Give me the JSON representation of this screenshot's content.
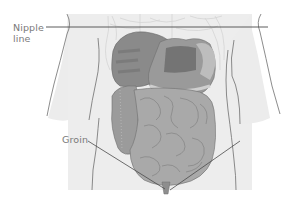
{
  "diagram": {
    "type": "anatomical-illustration",
    "labels": {
      "nipple_line_1": "Nipple",
      "nipple_line_2": "line",
      "groin": "Groin"
    },
    "colors": {
      "background": "#ffffff",
      "torso_shading": "#ececec",
      "outline": "#6e6e6e",
      "leader_line": "#4a4a4a",
      "liver": "#8a8a8a",
      "liver_dark": "#6f6f6f",
      "stomach": "#7f7f7f",
      "intestine": "#a9a9a9",
      "intestine_line": "#7c7c7c",
      "colon": "#9a9a9a",
      "rib": "#d6d6d6",
      "label_text": "#7a7a7a"
    }
  }
}
